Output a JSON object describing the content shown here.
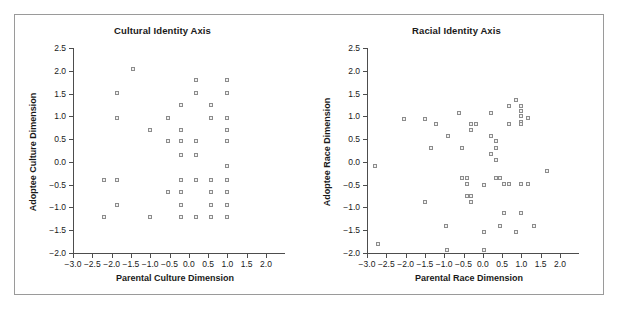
{
  "figure": {
    "background": "#ffffff",
    "frame_color": "#9a9a9a",
    "marker_color": "#8c8c8c",
    "axis_color": "#4d4d4d"
  },
  "chart_data": [
    {
      "type": "scatter",
      "title": "Cultural Identity Axis",
      "xlabel": "Parental Culture Dimension",
      "ylabel": "Adoptee Culture Dimension",
      "xlim": [
        -3.0,
        2.0
      ],
      "ylim": [
        -2.0,
        2.5
      ],
      "xticks": [
        "-3.0",
        "-2.5",
        "-2.0",
        "-1.5",
        "-1.0",
        "-0.5",
        "0.0",
        "0.5",
        "1.0",
        "1.5",
        "2.0"
      ],
      "xtick_values": [
        -3.0,
        -2.5,
        -2.0,
        -1.5,
        -1.0,
        -0.5,
        0.0,
        0.5,
        1.0,
        1.5,
        2.0
      ],
      "yticks": [
        "2.5",
        "2.0",
        "1.5",
        "1.0",
        "0.5",
        "0.0",
        "-0.5",
        "-1.0",
        "-1.5",
        "-2.0"
      ],
      "ytick_values": [
        2.5,
        2.0,
        1.5,
        1.0,
        0.5,
        0.0,
        -0.5,
        -1.0,
        -1.5,
        -2.0
      ],
      "grid": false,
      "legend": null,
      "marker": "open-square",
      "points": [
        [
          -1.45,
          2.05
        ],
        [
          -1.85,
          1.52
        ],
        [
          -1.85,
          0.97
        ],
        [
          -2.2,
          -0.4
        ],
        [
          -1.85,
          -0.4
        ],
        [
          -1.85,
          -0.95
        ],
        [
          -2.2,
          -1.2
        ],
        [
          -1.0,
          0.7
        ],
        [
          -1.0,
          -1.2
        ],
        [
          -0.55,
          0.97
        ],
        [
          -0.55,
          0.45
        ],
        [
          -0.55,
          -0.67
        ],
        [
          -0.2,
          1.24
        ],
        [
          -0.2,
          0.7
        ],
        [
          -0.2,
          0.45
        ],
        [
          -0.2,
          0.15
        ],
        [
          -0.2,
          -0.4
        ],
        [
          -0.2,
          -0.67
        ],
        [
          -0.2,
          -0.95
        ],
        [
          -0.2,
          -1.2
        ],
        [
          0.18,
          1.79
        ],
        [
          0.18,
          1.52
        ],
        [
          0.18,
          0.45
        ],
        [
          0.18,
          0.15
        ],
        [
          0.18,
          -0.4
        ],
        [
          0.18,
          -1.2
        ],
        [
          0.58,
          1.24
        ],
        [
          0.58,
          0.97
        ],
        [
          0.58,
          -0.4
        ],
        [
          0.58,
          -0.67
        ],
        [
          0.58,
          -0.95
        ],
        [
          0.58,
          -1.2
        ],
        [
          1.0,
          1.79
        ],
        [
          1.0,
          1.52
        ],
        [
          1.0,
          0.97
        ],
        [
          1.0,
          0.7
        ],
        [
          1.0,
          0.45
        ],
        [
          1.0,
          -0.1
        ],
        [
          1.0,
          -0.4
        ],
        [
          1.0,
          -0.67
        ],
        [
          1.0,
          -0.95
        ],
        [
          1.0,
          -1.2
        ]
      ]
    },
    {
      "type": "scatter",
      "title": "Racial Identity Axis",
      "xlabel": "Parental Race Dimension",
      "ylabel": "Adoptee Race Dimension",
      "xlim": [
        -3.0,
        2.0
      ],
      "ylim": [
        -2.0,
        2.5
      ],
      "xticks": [
        "-3.0",
        "-2.5",
        "-2.0",
        "-1.5",
        "-1.0",
        "-0.5",
        "0.0",
        "0.5",
        "1.0",
        "1.5",
        "2.0"
      ],
      "xtick_values": [
        -3.0,
        -2.5,
        -2.0,
        -1.5,
        -1.0,
        -0.5,
        0.0,
        0.5,
        1.0,
        1.5,
        2.0
      ],
      "yticks": [
        "2.5",
        "2.0",
        "1.5",
        "1.0",
        "0.5",
        "0.0",
        "-0.5",
        "-1.0",
        "-1.5",
        "-2.0"
      ],
      "ytick_values": [
        2.5,
        2.0,
        1.5,
        1.0,
        0.5,
        0.0,
        -0.5,
        -1.0,
        -1.5,
        -2.0
      ],
      "grid": false,
      "legend": null,
      "marker": "open-square",
      "points": [
        [
          -2.8,
          -0.08
        ],
        [
          -2.72,
          -1.8
        ],
        [
          -2.05,
          0.95
        ],
        [
          -1.5,
          0.95
        ],
        [
          -1.5,
          -0.88
        ],
        [
          -1.35,
          0.3
        ],
        [
          -1.2,
          0.83
        ],
        [
          -0.95,
          -1.4
        ],
        [
          -0.92,
          -1.93
        ],
        [
          -0.9,
          0.56
        ],
        [
          -0.62,
          1.08
        ],
        [
          -0.55,
          0.3
        ],
        [
          -0.55,
          -0.36
        ],
        [
          -0.42,
          -0.36
        ],
        [
          -0.42,
          -0.48
        ],
        [
          -0.42,
          -0.75
        ],
        [
          -0.3,
          0.7
        ],
        [
          -0.3,
          0.83
        ],
        [
          -0.3,
          -0.75
        ],
        [
          -0.3,
          -0.87
        ],
        [
          -0.18,
          0.84
        ],
        [
          0.02,
          -0.5
        ],
        [
          0.02,
          -1.53
        ],
        [
          0.03,
          -1.93
        ],
        [
          0.2,
          1.08
        ],
        [
          0.2,
          0.56
        ],
        [
          0.2,
          0.18
        ],
        [
          0.35,
          0.45
        ],
        [
          0.35,
          0.3
        ],
        [
          0.35,
          0.05
        ],
        [
          0.35,
          -0.36
        ],
        [
          0.45,
          -0.36
        ],
        [
          0.45,
          -1.4
        ],
        [
          0.55,
          -0.48
        ],
        [
          0.55,
          -1.13
        ],
        [
          0.68,
          1.22
        ],
        [
          0.68,
          0.84
        ],
        [
          0.68,
          -0.48
        ],
        [
          0.85,
          1.36
        ],
        [
          0.85,
          -1.53
        ],
        [
          1.0,
          1.22
        ],
        [
          1.0,
          1.12
        ],
        [
          1.0,
          1.0
        ],
        [
          1.0,
          0.88
        ],
        [
          1.0,
          0.84
        ],
        [
          1.0,
          -0.48
        ],
        [
          1.0,
          -1.13
        ],
        [
          1.18,
          0.96
        ],
        [
          1.18,
          -0.48
        ],
        [
          1.32,
          -1.4
        ],
        [
          1.66,
          -0.2
        ]
      ]
    }
  ]
}
